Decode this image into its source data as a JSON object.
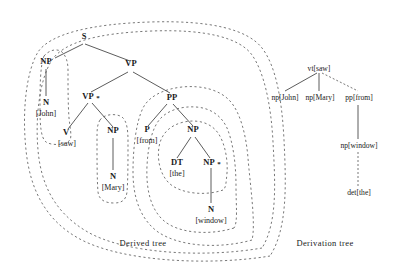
{
  "figure": {
    "title_derived": "Derived  tree",
    "title_derivation": "Derivation  tree",
    "colors": {
      "ink": "#1a1a1a",
      "edge": "#4a4a4a",
      "contour": "#555555",
      "background": "#ffffff"
    }
  },
  "derived_tree": {
    "caption": "Derived  tree",
    "nodes": {
      "s": "S",
      "np_subj": "NP",
      "vp": "VP",
      "n_john": "N",
      "john": "[John]",
      "vp_foot": "VP",
      "vp_foot_star": "*",
      "pp": "PP",
      "v": "V",
      "saw": "[saw]",
      "np_obj": "NP",
      "n_mary": "N",
      "mary": "[Mary]",
      "p": "P",
      "from": "[from]",
      "np_pp": "NP",
      "dt": "DT",
      "the": "[the]",
      "np_foot": "NP",
      "np_foot_star": "*",
      "n_window": "N",
      "window": "[window]"
    }
  },
  "derivation_tree": {
    "caption": "Derivation  tree",
    "nodes": {
      "root": "vt[saw]",
      "john": "np[John]",
      "mary": "np[Mary]",
      "from": "pp[from]",
      "window": "np[window]",
      "the": "det[the]"
    },
    "edges": [
      {
        "from": "vt[saw]",
        "to": "np[John]",
        "style": "solid"
      },
      {
        "from": "vt[saw]",
        "to": "np[Mary]",
        "style": "solid"
      },
      {
        "from": "vt[saw]",
        "to": "pp[from]",
        "style": "dashed"
      },
      {
        "from": "pp[from]",
        "to": "np[window]",
        "style": "solid"
      },
      {
        "from": "np[window]",
        "to": "det[the]",
        "style": "dashed"
      }
    ]
  }
}
